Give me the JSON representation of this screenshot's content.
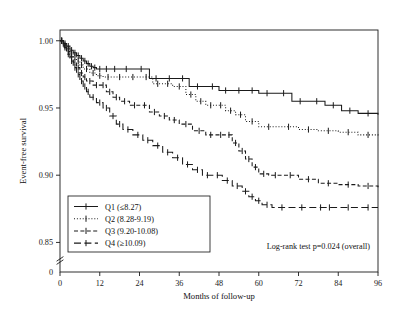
{
  "chart_data": {
    "type": "line",
    "title": "",
    "xlabel": "Months of follow-up",
    "ylabel": "Event-free survival",
    "xlim": [
      0,
      96
    ],
    "ylim": [
      0.828,
      1.008
    ],
    "xticks": [
      "0",
      "12",
      "24",
      "36",
      "48",
      "60",
      "72",
      "84",
      "96"
    ],
    "xtick_values": [
      0,
      12,
      24,
      36,
      48,
      60,
      72,
      84,
      96
    ],
    "yticks": [
      "1.00",
      "0.95",
      "0.90",
      "0.85",
      "0"
    ],
    "ytick_values": [
      1.0,
      0.95,
      0.9,
      0.85
    ],
    "y_axis_break": true,
    "y_origin_label": "0",
    "grid": false,
    "legend_position": "bottom-left",
    "annotation": "Log-rank test p=0.024 (overall)",
    "series": [
      {
        "name": "Q1 (≤8.27)",
        "label": "Q1 (≤8.27)",
        "style": "solid",
        "color": "#1a1a1a",
        "final_value": 0.945,
        "x": [
          0,
          1,
          2,
          3,
          4,
          5,
          6,
          7,
          8,
          9,
          10,
          11,
          13,
          15,
          18,
          22,
          27,
          31,
          35,
          39,
          44,
          48,
          52,
          56,
          60,
          65,
          70,
          75,
          80,
          85,
          90,
          96
        ],
        "y": [
          1.0,
          0.998,
          0.996,
          0.993,
          0.991,
          0.989,
          0.987,
          0.985,
          0.983,
          0.981,
          0.98,
          0.979,
          0.979,
          0.979,
          0.979,
          0.979,
          0.972,
          0.972,
          0.972,
          0.966,
          0.966,
          0.963,
          0.963,
          0.963,
          0.961,
          0.961,
          0.955,
          0.955,
          0.952,
          0.948,
          0.946,
          0.945
        ]
      },
      {
        "name": "Q2 (8.28-9.19)",
        "label": "Q2 (8.28-9.19)",
        "style": "dotted",
        "color": "#1a1a1a",
        "final_value": 0.929,
        "x": [
          0,
          1,
          2,
          3,
          4,
          5,
          6,
          7,
          9,
          11,
          13,
          16,
          20,
          24,
          28,
          31,
          34,
          38,
          41,
          44,
          47,
          50,
          53,
          56,
          60,
          66,
          72,
          78,
          84,
          90,
          96
        ],
        "y": [
          1.0,
          0.997,
          0.994,
          0.991,
          0.988,
          0.985,
          0.982,
          0.979,
          0.976,
          0.974,
          0.973,
          0.973,
          0.973,
          0.973,
          0.968,
          0.968,
          0.966,
          0.96,
          0.955,
          0.952,
          0.952,
          0.948,
          0.945,
          0.94,
          0.936,
          0.936,
          0.934,
          0.933,
          0.932,
          0.93,
          0.929
        ]
      },
      {
        "name": "Q3 (9.20-10.08)",
        "label": "Q3 (9.20-10.08)",
        "style": "dashed",
        "color": "#1a1a1a",
        "final_value": 0.891,
        "x": [
          0,
          1,
          2,
          3,
          4,
          5,
          6,
          7,
          8,
          10,
          12,
          14,
          16,
          18,
          21,
          24,
          27,
          30,
          33,
          36,
          40,
          44,
          47,
          50,
          52,
          54,
          56,
          58,
          60,
          63,
          67,
          72,
          78,
          84,
          90,
          96
        ],
        "y": [
          1.0,
          0.996,
          0.992,
          0.988,
          0.984,
          0.98,
          0.976,
          0.973,
          0.97,
          0.967,
          0.967,
          0.962,
          0.958,
          0.955,
          0.952,
          0.952,
          0.947,
          0.944,
          0.941,
          0.938,
          0.933,
          0.93,
          0.93,
          0.93,
          0.924,
          0.918,
          0.912,
          0.906,
          0.901,
          0.9,
          0.9,
          0.897,
          0.894,
          0.893,
          0.892,
          0.891
        ]
      },
      {
        "name": "Q4 (≥10.09)",
        "label": "Q4 (≥10.09)",
        "style": "longdash",
        "color": "#1a1a1a",
        "final_value": 0.876,
        "x": [
          0,
          1,
          2,
          3,
          4,
          5,
          6,
          7,
          8,
          9,
          11,
          13,
          15,
          17,
          19,
          22,
          25,
          28,
          31,
          34,
          37,
          40,
          43,
          46,
          49,
          52,
          55,
          57,
          59,
          61,
          64,
          70,
          76,
          84,
          90,
          96
        ],
        "y": [
          1.0,
          0.995,
          0.99,
          0.985,
          0.98,
          0.975,
          0.97,
          0.966,
          0.962,
          0.958,
          0.954,
          0.95,
          0.944,
          0.938,
          0.934,
          0.93,
          0.926,
          0.922,
          0.917,
          0.913,
          0.908,
          0.904,
          0.9,
          0.9,
          0.896,
          0.892,
          0.888,
          0.884,
          0.881,
          0.878,
          0.876,
          0.876,
          0.876,
          0.876,
          0.876,
          0.876
        ]
      }
    ]
  },
  "legend": {
    "items": [
      {
        "label": "Q1 (≤8.27)",
        "style": "solid"
      },
      {
        "label": "Q2 (8.28-9.19)",
        "style": "dotted"
      },
      {
        "label": "Q3 (9.20-10.08)",
        "style": "dashed"
      },
      {
        "label": "Q4 (≥10.09)",
        "style": "longdash"
      }
    ]
  }
}
